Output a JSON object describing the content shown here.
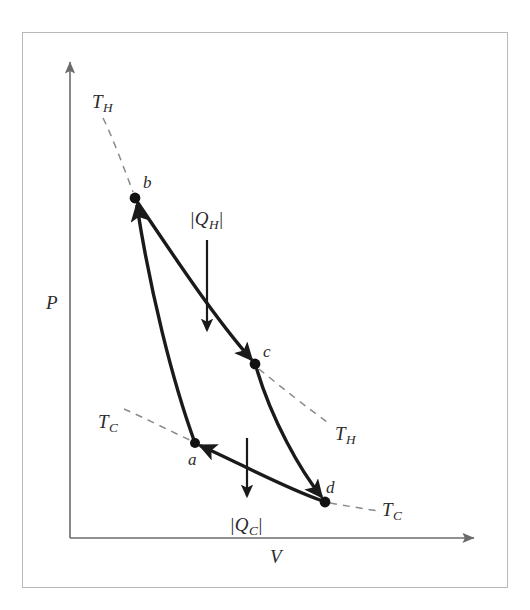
{
  "figure": {
    "type": "pv-diagram",
    "colors": {
      "frame": "#b9b9b9",
      "axis": "#6b6b6b",
      "cycle_path": "#1a1a1a",
      "isotherm_dashed": "#8a8a8a",
      "heat_arrow": "#1a1a1a",
      "label_text": "#2b2b2b"
    }
  },
  "axes": {
    "y_label": "P",
    "x_label": "V",
    "origin": {
      "x": 70,
      "y": 538
    },
    "y_axis_tip": {
      "x": 70,
      "y": 58
    },
    "x_axis_tip": {
      "x": 478,
      "y": 538
    }
  },
  "states": [
    {
      "id": "a",
      "label": "a",
      "x": 195,
      "y": 443,
      "label_x": 188,
      "label_y": 451
    },
    {
      "id": "b",
      "label": "b",
      "x": 135,
      "y": 198,
      "label_x": 143,
      "label_y": 174
    },
    {
      "id": "c",
      "label": "c",
      "x": 255,
      "y": 364,
      "label_x": 263,
      "label_y": 343
    },
    {
      "id": "d",
      "label": "d",
      "x": 325,
      "y": 502,
      "label_x": 326,
      "label_y": 479
    }
  ],
  "processes": [
    {
      "from": "a",
      "to": "b",
      "kind": "adiabatic-compression",
      "path": "M 195 443 C 172 380 150 290 137 206"
    },
    {
      "from": "b",
      "to": "c",
      "kind": "isothermal-expansion-TH",
      "path": "M 138 203 C 175 258 215 318 251 359"
    },
    {
      "from": "c",
      "to": "d",
      "kind": "adiabatic-expansion",
      "path": "M 257 370 C 272 420 300 470 321 496"
    },
    {
      "from": "d",
      "to": "a",
      "kind": "isothermal-compression-TC",
      "path": "M 320 500 C 283 487 237 462 201 446"
    }
  ],
  "isotherm_labels": [
    {
      "text": "T",
      "sub": "H",
      "x": 92,
      "y": 92,
      "anchor": "upper-left",
      "dash_path": "M 103 118 C 112 136 124 168 133 192"
    },
    {
      "text": "T",
      "sub": "C",
      "x": 98,
      "y": 412,
      "anchor": "lower-left",
      "dash_path": "M 124 409 C 145 418 172 432 192 441"
    },
    {
      "text": "T",
      "sub": "H",
      "x": 335,
      "y": 424,
      "anchor": "lower-right",
      "dash_path": "M 259 369 C 281 387 310 410 330 424"
    },
    {
      "text": "T",
      "sub": "C",
      "x": 382,
      "y": 500,
      "anchor": "lower-right",
      "dash_path": "M 330 503 C 347 506 366 509 378 511"
    }
  ],
  "heat_flows": [
    {
      "id": "QH",
      "label_prefix": "|",
      "label": "Q",
      "sub": "H",
      "label_suffix": "|",
      "label_x": 190,
      "label_y": 209,
      "arrow_from": {
        "x": 207,
        "y": 240
      },
      "arrow_to": {
        "x": 207,
        "y": 336
      },
      "direction": "down",
      "meaning": "heat absorbed from hot reservoir"
    },
    {
      "id": "QC",
      "label_prefix": "|",
      "label": "Q",
      "sub": "C",
      "label_suffix": "|",
      "label_x": 230,
      "label_y": 515,
      "arrow_from": {
        "x": 247,
        "y": 438
      },
      "arrow_to": {
        "x": 247,
        "y": 502
      },
      "direction": "down",
      "meaning": "heat rejected to cold reservoir"
    }
  ]
}
